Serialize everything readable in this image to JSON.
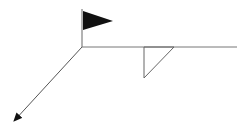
{
  "diagram": {
    "width": 251,
    "height": 125,
    "background": "#ffffff",
    "stroke_color": "#555555",
    "fill_color": "#111111",
    "elements": {
      "pole": {
        "x": 82,
        "y1": 9,
        "y2": 47
      },
      "flag": {
        "points": "83,11 113,21 83,30"
      },
      "horizontal_line": {
        "x1": 82,
        "x2": 237,
        "y": 47
      },
      "arrow": {
        "x1": 82,
        "y1": 47,
        "x2": 14,
        "y2": 121
      },
      "triangle": {
        "points": "144,47 144,78 174,47"
      }
    }
  }
}
